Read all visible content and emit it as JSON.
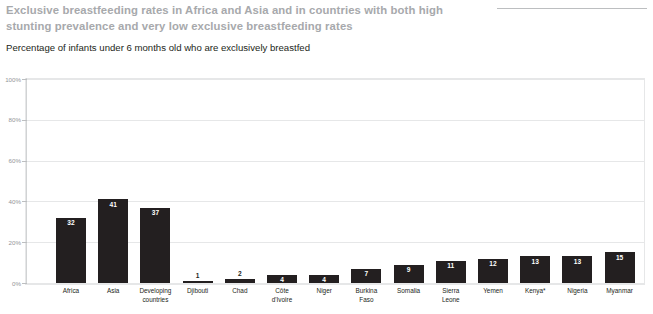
{
  "header": {
    "title": "Exclusive breastfeeding rates in Africa and Asia and in countries with both high stunting prevalence and very low exclusive breastfeeding rates",
    "subtitle": "Percentage of infants under 6 months old who are exclusively breastfed",
    "title_color": "#a7a9ac",
    "subtitle_color": "#231f20"
  },
  "chart_data": {
    "type": "bar",
    "title": "Exclusive breastfeeding rates in Africa and Asia and in countries with both high stunting prevalence and very low exclusive breastfeeding rates",
    "subtitle": "Percentage of infants under 6 months old who are exclusively breastfed",
    "xlabel": "",
    "ylabel": "",
    "ylim": [
      0,
      100
    ],
    "grid": true,
    "legend": "none",
    "bar_color": "#231f20",
    "yticks": [
      "0%",
      "20%",
      "40%",
      "60%",
      "80%",
      "100%"
    ],
    "ytick_values": [
      0,
      20,
      40,
      60,
      80,
      100
    ],
    "categories": [
      "Africa",
      "Asia",
      "Developing countries",
      "Djibouti",
      "Chad",
      "Côte d'Ivoire",
      "Niger",
      "Burkina Faso",
      "Somalia",
      "Sierra Leone",
      "Yemen",
      "Kenya*",
      "Nigeria",
      "Myanmar"
    ],
    "category_lines": [
      [
        "Africa"
      ],
      [
        "Asia"
      ],
      [
        "Developing",
        "countries"
      ],
      [
        "Djibouti"
      ],
      [
        "Chad"
      ],
      [
        "Côte",
        "d'Ivoire"
      ],
      [
        "Niger"
      ],
      [
        "Burkina",
        "Faso"
      ],
      [
        "Somalia"
      ],
      [
        "Sierra",
        "Leone"
      ],
      [
        "Yemen"
      ],
      [
        "Kenya*"
      ],
      [
        "Nigeria"
      ],
      [
        "Myanmar"
      ]
    ],
    "values": [
      32,
      41,
      37,
      1,
      2,
      4,
      4,
      7,
      9,
      11,
      12,
      13,
      13,
      15
    ],
    "value_labels": [
      "32",
      "41",
      "37",
      "1",
      "2",
      "4",
      "4",
      "7",
      "9",
      "11",
      "12",
      "13",
      "13",
      "15"
    ],
    "label_placement": [
      "inside",
      "inside",
      "inside",
      "above",
      "above",
      "inside",
      "inside",
      "inside",
      "inside",
      "inside",
      "inside",
      "inside",
      "inside",
      "inside"
    ]
  }
}
